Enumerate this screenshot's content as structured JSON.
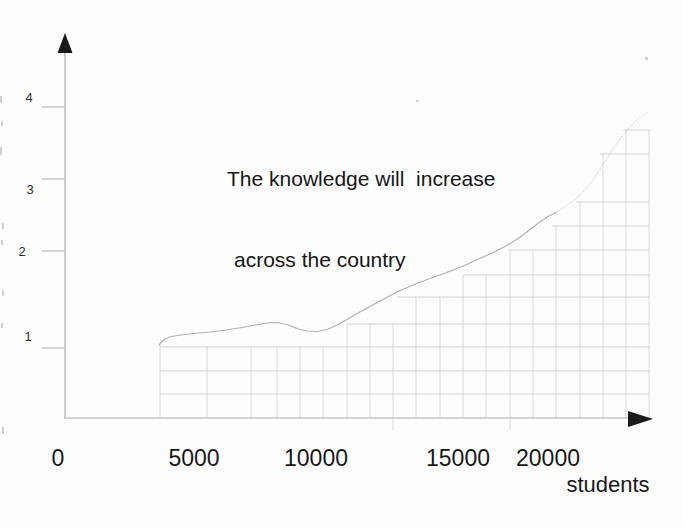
{
  "meta": {
    "width_px": 683,
    "height_px": 527,
    "background": "#fdfdfd"
  },
  "title": {
    "line1": "The knowledge will  increase",
    "line2": "across the country",
    "pos": [
      227,
      111
    ]
  },
  "x_axis_title": {
    "text": "students",
    "pos": [
      608,
      472
    ]
  },
  "y_tick_labels": [
    {
      "t": "4",
      "pos": [
        29,
        97
      ]
    },
    {
      "t": "3",
      "pos": [
        30,
        189
      ]
    },
    {
      "t": "2",
      "pos": [
        22,
        251
      ]
    },
    {
      "t": "1",
      "pos": [
        28,
        336
      ]
    }
  ],
  "x_tick_labels": [
    {
      "t": "0",
      "pos": [
        58,
        445
      ]
    },
    {
      "t": "5000",
      "pos": [
        194,
        445
      ]
    },
    {
      "t": "10000",
      "pos": [
        316,
        445
      ]
    },
    {
      "t": "15000",
      "pos": [
        458,
        445
      ]
    },
    {
      "t": "20000",
      "pos": [
        548,
        445
      ]
    }
  ],
  "chart_data": {
    "type": "line",
    "title": "The knowledge will increase across the country",
    "xlabel": "students",
    "ylabel": "",
    "x_tick_values": [
      0,
      5000,
      10000,
      15000,
      20000
    ],
    "y_tick_values": [
      1,
      2,
      3,
      4
    ],
    "xlim": [
      0,
      25600
    ],
    "ylim": [
      0,
      4.5
    ],
    "grid": "square grid cells fill only the staircase area under the curve, from x≈3800 students to right edge",
    "legend": "none",
    "series": [
      {
        "name": "knowledge level",
        "style": "thin light-gray freehand curve, fading/dotted toward upper right",
        "x": [
          3800,
          5000,
          6000,
          7000,
          7800,
          9000,
          9700,
          10000,
          11000,
          12000,
          13000,
          14000,
          15000,
          16000,
          17000,
          18000,
          19000,
          20000,
          21000,
          22000,
          23000,
          24000,
          25000,
          25600
        ],
        "values": [
          1.0,
          1.14,
          1.17,
          1.21,
          1.25,
          1.2,
          1.16,
          1.17,
          1.29,
          1.44,
          1.59,
          1.72,
          1.83,
          1.92,
          2.0,
          2.13,
          2.33,
          2.49,
          2.64,
          2.85,
          3.26,
          3.58,
          3.82,
          3.93
        ]
      }
    ]
  },
  "render": {
    "axis_color": "#c2c6c6",
    "arrow_color": "#1a1a1a",
    "grid_color": "#c6cbcb",
    "grid_opacity": 0.8,
    "curve_color": "#9aa0a0",
    "y_axis": {
      "x": 65,
      "y1": 50,
      "y2": 419
    },
    "x_axis": {
      "y": 418,
      "x1": 65,
      "x2": 630
    },
    "y_arrow_points": "65,33 57.5,53 72.5,53",
    "x_arrow_points": "628,411 628,427 653,419",
    "y_ticks_px": [
      107,
      179,
      251,
      348
    ],
    "grid_right": 649,
    "grid_bottom": 418,
    "rows": [
      [
        130,
        623
      ],
      [
        154,
        600
      ],
      [
        202,
        576
      ],
      [
        226,
        552
      ],
      [
        250,
        508
      ],
      [
        275,
        463
      ],
      [
        297,
        397
      ],
      [
        324,
        347
      ],
      [
        347,
        160
      ],
      [
        371,
        160
      ],
      [
        394,
        160
      ]
    ],
    "cols": [
      [
        160,
        345
      ],
      [
        207,
        346
      ],
      [
        251,
        346
      ],
      [
        277,
        346
      ],
      [
        300,
        346
      ],
      [
        323,
        346
      ],
      [
        347,
        324
      ],
      [
        370,
        324
      ],
      [
        393,
        324
      ],
      [
        416,
        297
      ],
      [
        440,
        297
      ],
      [
        463,
        275
      ],
      [
        486,
        275
      ],
      [
        510,
        250
      ],
      [
        533,
        250
      ],
      [
        556,
        226
      ],
      [
        580,
        202
      ],
      [
        603,
        154
      ],
      [
        626,
        130
      ],
      [
        649,
        130
      ]
    ],
    "col_overshoots": [
      393,
      510
    ],
    "curve_solid": "159,345 164,339.5 171,336.5 181,335 194,333.5 210,332 226,330 242,327.5 256,325 267,323 277,322.5 287,324.5 297,328.5 307,331 317,331.5 327,329.5 337,325 347,319.5 358,313 370,306.5 382,300 394,293.5 406,288 418,283 430,278.5 441,274.5 452,270.5 462,266.5 472,262 482,257.5 492,253 502,248 512,242.5 521,236.5 530,229.5 539,222.5 548,216.5 553,214 557,212",
    "curve_faint": "557,212 566,206 575,199.5 584,191 593,180 602,166 611,152 620,139 629,128 638,119 648,112",
    "specks": [
      [
        0,
        96,
        2,
        7
      ],
      [
        1,
        121,
        2,
        5
      ],
      [
        0,
        147,
        2,
        8
      ],
      [
        2,
        223,
        2,
        6
      ],
      [
        1,
        240,
        2,
        5
      ],
      [
        2,
        290,
        2,
        6
      ],
      [
        1,
        323,
        2,
        5
      ],
      [
        2,
        427,
        2,
        7
      ],
      [
        645,
        57,
        3,
        3
      ],
      [
        416,
        100,
        3,
        2
      ]
    ]
  }
}
